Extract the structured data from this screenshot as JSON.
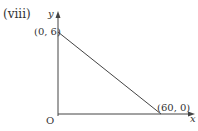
{
  "label": "(viii)",
  "axes": {
    "x": "x",
    "y": "y",
    "origin": "O"
  },
  "points": [
    {
      "label": "(0, 6)",
      "x": 0,
      "y": 6
    },
    {
      "label": "(60, 0)",
      "x": 60,
      "y": 0
    }
  ],
  "colors": {
    "line": "#444444"
  }
}
